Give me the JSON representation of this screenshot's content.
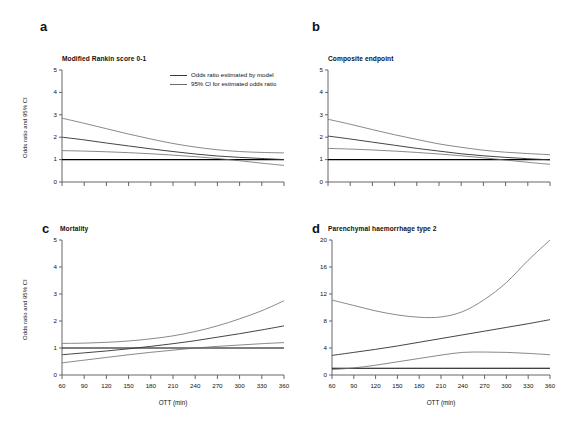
{
  "figure": {
    "background_color": "#ffffff",
    "line_color": "#3a3a3a",
    "ci_line_color": "#6b6b6b",
    "ref_line_color": "#000000",
    "axis_color": "#555555"
  },
  "legend": {
    "position": "panel-a-top-right",
    "entries": [
      {
        "label": "Odds ratio estimated by model",
        "style": "solid-dark"
      },
      {
        "label": "95% CI for estimated odds ratio",
        "style": "solid-grey"
      }
    ]
  },
  "axis_labels": {
    "y": "Odds ratio and 95% CI",
    "x": "OTT (min)"
  },
  "chart_data": [
    {
      "type": "line",
      "panel": "a",
      "title": "Modified Rankin score  0-1",
      "xlabel": "",
      "ylabel": "Odds ratio and 95% CI",
      "xlim": [
        60,
        360
      ],
      "ylim": [
        0,
        5
      ],
      "xticks": [
        60,
        90,
        120,
        150,
        180,
        210,
        240,
        270,
        300,
        330,
        360
      ],
      "yticks": [
        0,
        1,
        2,
        3,
        4,
        5
      ],
      "grid": false,
      "reference_line": 1,
      "x": [
        60,
        90,
        120,
        150,
        180,
        210,
        240,
        270,
        300,
        330,
        360
      ],
      "series": [
        {
          "name": "Odds ratio estimated by model",
          "values": [
            2.0,
            1.88,
            1.74,
            1.61,
            1.48,
            1.36,
            1.25,
            1.16,
            1.1,
            1.05,
            1.0
          ]
        },
        {
          "name": "95% CI upper",
          "values": [
            2.85,
            2.62,
            2.38,
            2.14,
            1.92,
            1.72,
            1.56,
            1.44,
            1.36,
            1.32,
            1.3
          ]
        },
        {
          "name": "95% CI lower",
          "values": [
            1.4,
            1.38,
            1.35,
            1.31,
            1.26,
            1.2,
            1.13,
            1.05,
            0.95,
            0.84,
            0.74
          ]
        }
      ]
    },
    {
      "type": "line",
      "panel": "b",
      "title": "Composite endpoint",
      "xlabel": "",
      "ylabel": "",
      "xlim": [
        60,
        360
      ],
      "ylim": [
        0,
        5
      ],
      "xticks": [
        60,
        90,
        120,
        150,
        180,
        210,
        240,
        270,
        300,
        330,
        360
      ],
      "yticks": [
        0,
        1,
        2,
        3,
        4,
        5
      ],
      "grid": false,
      "reference_line": 1,
      "x": [
        60,
        90,
        120,
        150,
        180,
        210,
        240,
        270,
        300,
        330,
        360
      ],
      "series": [
        {
          "name": "Odds ratio estimated by model",
          "values": [
            2.05,
            1.92,
            1.78,
            1.64,
            1.5,
            1.38,
            1.26,
            1.17,
            1.1,
            1.04,
            0.99
          ]
        },
        {
          "name": "95% CI upper",
          "values": [
            2.8,
            2.58,
            2.34,
            2.11,
            1.9,
            1.7,
            1.55,
            1.42,
            1.33,
            1.27,
            1.22
          ]
        },
        {
          "name": "95% CI lower",
          "values": [
            1.5,
            1.47,
            1.43,
            1.38,
            1.32,
            1.25,
            1.17,
            1.08,
            0.98,
            0.88,
            0.79
          ]
        }
      ]
    },
    {
      "type": "line",
      "panel": "c",
      "title": "Mortality",
      "xlabel": "OTT (min)",
      "ylabel": "Odds ratio and 95% CI",
      "xlim": [
        60,
        360
      ],
      "ylim": [
        0,
        5
      ],
      "xticks": [
        60,
        90,
        120,
        150,
        180,
        210,
        240,
        270,
        300,
        330,
        360
      ],
      "yticks": [
        0,
        1,
        2,
        3,
        4,
        5
      ],
      "grid": false,
      "reference_line": 1,
      "x": [
        60,
        90,
        120,
        150,
        180,
        210,
        240,
        270,
        300,
        330,
        360
      ],
      "series": [
        {
          "name": "Odds ratio estimated by model",
          "values": [
            0.75,
            0.82,
            0.89,
            0.97,
            1.06,
            1.16,
            1.27,
            1.4,
            1.53,
            1.67,
            1.82
          ]
        },
        {
          "name": "95% CI upper",
          "values": [
            1.17,
            1.18,
            1.21,
            1.26,
            1.34,
            1.45,
            1.61,
            1.82,
            2.08,
            2.38,
            2.75
          ]
        },
        {
          "name": "95% CI lower",
          "values": [
            0.45,
            0.55,
            0.65,
            0.75,
            0.84,
            0.92,
            1.0,
            1.06,
            1.11,
            1.16,
            1.2
          ]
        }
      ]
    },
    {
      "type": "line",
      "panel": "d",
      "title": "Parenchymal haemorrhage type 2",
      "xlabel": "OTT (min)",
      "ylabel": "",
      "xlim": [
        60,
        360
      ],
      "ylim": [
        0,
        20
      ],
      "xticks": [
        60,
        90,
        120,
        150,
        180,
        210,
        240,
        270,
        300,
        330,
        360
      ],
      "yticks": [
        0,
        4,
        8,
        12,
        16,
        20
      ],
      "grid": false,
      "reference_line": 1,
      "x": [
        60,
        90,
        120,
        150,
        180,
        210,
        240,
        270,
        300,
        330,
        360
      ],
      "series": [
        {
          "name": "Odds ratio estimated by model",
          "values": [
            2.9,
            3.35,
            3.8,
            4.3,
            4.85,
            5.4,
            5.95,
            6.5,
            7.05,
            7.6,
            8.2
          ]
        },
        {
          "name": "95% CI upper",
          "values": [
            11.1,
            10.3,
            9.5,
            8.9,
            8.55,
            8.6,
            9.4,
            11.2,
            13.7,
            17.0,
            20.0
          ]
        },
        {
          "name": "95% CI lower",
          "values": [
            0.8,
            1.05,
            1.45,
            1.95,
            2.45,
            2.95,
            3.35,
            3.4,
            3.35,
            3.2,
            3.0
          ]
        }
      ]
    }
  ],
  "panels": [
    {
      "letter": "a",
      "title": "Modified Rankin score  0-1"
    },
    {
      "letter": "b",
      "title": "Composite endpoint"
    },
    {
      "letter": "c",
      "title": "Mortality"
    },
    {
      "letter": "d",
      "title": "Parenchymal haemorrhage type 2"
    }
  ]
}
